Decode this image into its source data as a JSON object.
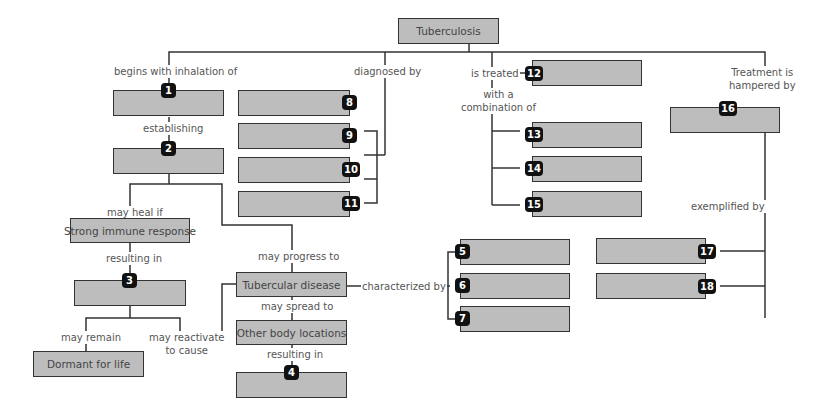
{
  "diagram": {
    "type": "concept-map",
    "root": "Tuberculosis",
    "boxes": {
      "root": "Tuberculosis",
      "strong_immune": "Strong immune response",
      "dormant": "Dormant for life",
      "tb_disease": "Tubercular disease",
      "other_locations": "Other body locations"
    },
    "labels": {
      "begins_with": "begins with inhalation of",
      "establishing": "establishing",
      "may_heal_if": "may heal if",
      "resulting_in_1": "resulting in",
      "may_remain": "may remain",
      "may_reactivate": "may reactivate\nto cause",
      "may_progress": "may progress to",
      "may_spread": "may spread to",
      "resulting_in_2": "resulting in",
      "characterized_by": "characterized by",
      "diagnosed_by": "diagnosed by",
      "is_treated": "is treated",
      "with_combination": "with a\ncombination of",
      "treatment_hampered": "Treatment is\nhampered by",
      "exemplified_by": "exemplified by"
    },
    "numbers": [
      "1",
      "2",
      "3",
      "4",
      "5",
      "6",
      "7",
      "8",
      "9",
      "10",
      "11",
      "12",
      "13",
      "14",
      "15",
      "16",
      "17",
      "18"
    ],
    "colors": {
      "box_fill": "#bdbdbd",
      "box_border": "#333333",
      "badge": "#111111",
      "line": "#333333"
    }
  }
}
